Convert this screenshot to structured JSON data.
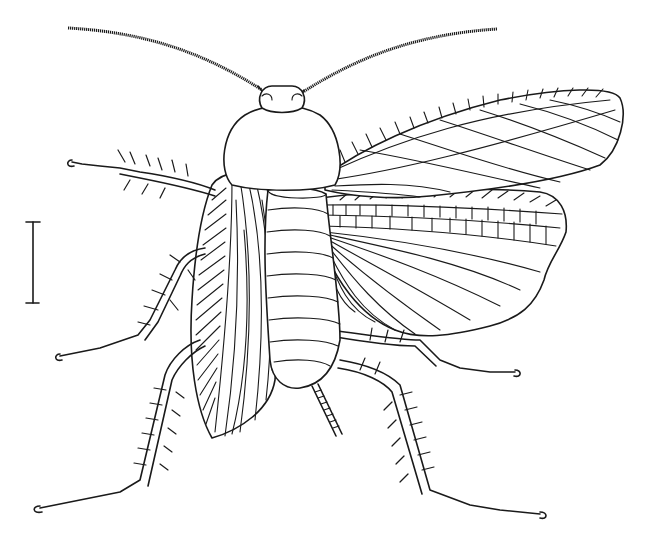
{
  "figure": {
    "style": "black-and-white line illustration",
    "view": "dorsal, right wings spread",
    "scale_bar": {
      "present": true,
      "orientation": "vertical"
    },
    "colors": {
      "ink": "#1a1a1a",
      "background": "#ffffff"
    }
  }
}
